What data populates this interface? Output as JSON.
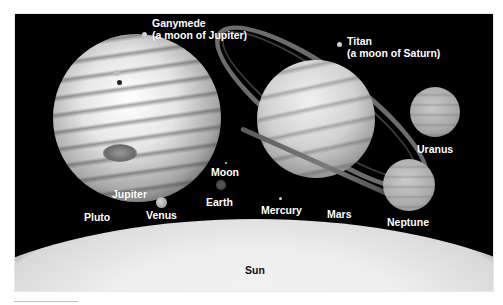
{
  "figure": {
    "labels": {
      "ganymede_line1": "Ganymede",
      "ganymede_line2": "(a moon of Jupiter)",
      "titan_line1": "Titan",
      "titan_line2": "(a moon of Saturn)",
      "uranus": "Uranus",
      "neptune": "Neptune",
      "moon": "Moon",
      "earth": "Earth",
      "jupiter": "Jupiter",
      "pluto": "Pluto",
      "venus": "Venus",
      "mercury": "Mercury",
      "mars": "Mars",
      "sun": "Sun"
    },
    "colors": {
      "space": "#000000",
      "sun": "#eeeeee",
      "label_light": "#ffffff",
      "label_dark": "#111111"
    }
  }
}
